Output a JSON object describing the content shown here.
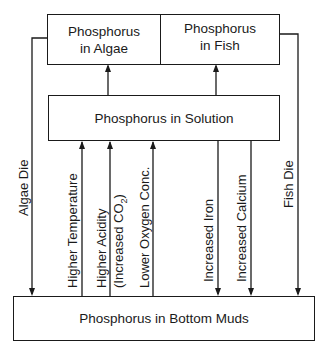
{
  "diagram": {
    "title": "",
    "nodes": {
      "algae": {
        "line1": "Phosphorus",
        "line2": "in Algae"
      },
      "fish": {
        "line1": "Phosphorus",
        "line2": "in Fish"
      },
      "solution": {
        "label": "Phosphorus in Solution"
      },
      "muds": {
        "label": "Phosphorus in Bottom Muds"
      }
    },
    "edges": {
      "algae_die": "Algae Die",
      "higher_temperature": "Higher Temperature",
      "higher_acidity": "Higher Acidity",
      "increased_co2_prefix": "(Increased CO",
      "increased_co2_sub": "2",
      "increased_co2_suffix": ")",
      "lower_oxygen": "Lower Oxygen Conc.",
      "increased_iron": "Increased Iron",
      "increased_calcium": "Increased Calcium",
      "fish_die": "Fish Die"
    }
  }
}
